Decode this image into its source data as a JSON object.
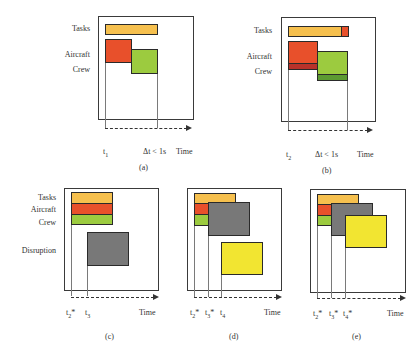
{
  "colors": {
    "tasks": "#f6c04e",
    "aircraft": "#e8502b",
    "aircraft_dark": "#b8322a",
    "crew": "#9ccb3f",
    "crew_dark": "#5c9a32",
    "disruption": "#787878",
    "new_event": "#f2e531",
    "frame": "#3a3a3a"
  },
  "row_labels": {
    "tasks": "Tasks",
    "aircraft": "Aircraft",
    "crew": "Crew",
    "disruption": "Disruption"
  },
  "panels": [
    {
      "id": "a",
      "caption": "(a)",
      "axis_label": "Time",
      "ticks": [
        "t1",
        "Δt < 1s"
      ],
      "tick_display": [
        {
          "base": "t",
          "sub": "1",
          "sup": ""
        },
        {
          "base": "Δt < 1s",
          "sub": "",
          "sup": ""
        }
      ]
    },
    {
      "id": "b",
      "caption": "(b)",
      "axis_label": "Time",
      "ticks": [
        "t2",
        "Δt < 1s"
      ],
      "tick_display": [
        {
          "base": "t",
          "sub": "2",
          "sup": ""
        },
        {
          "base": "Δt < 1s",
          "sub": "",
          "sup": ""
        }
      ]
    },
    {
      "id": "c",
      "caption": "(c)",
      "axis_label": "Time",
      "ticks": [
        "t2*",
        "t3"
      ],
      "tick_display": [
        {
          "base": "t",
          "sub": "2",
          "sup": "*"
        },
        {
          "base": "t",
          "sub": "3",
          "sup": ""
        }
      ]
    },
    {
      "id": "d",
      "caption": "(d)",
      "axis_label": "Time",
      "ticks": [
        "t2*",
        "t3*",
        "t4"
      ],
      "tick_display": [
        {
          "base": "t",
          "sub": "2",
          "sup": "*"
        },
        {
          "base": "t",
          "sub": "3",
          "sup": "*"
        },
        {
          "base": "t",
          "sub": "4",
          "sup": ""
        }
      ]
    },
    {
      "id": "e",
      "caption": "(e)",
      "axis_label": "Time",
      "ticks": [
        "t2*",
        "t3*",
        "t4*"
      ],
      "tick_display": [
        {
          "base": "t",
          "sub": "2",
          "sup": "*"
        },
        {
          "base": "t",
          "sub": "3",
          "sup": "*"
        },
        {
          "base": "t",
          "sub": "4",
          "sup": "*"
        }
      ]
    }
  ]
}
